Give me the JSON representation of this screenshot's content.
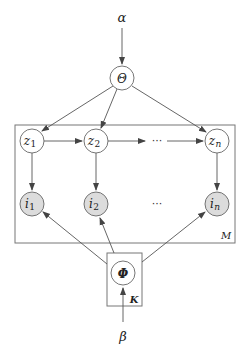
{
  "diagram": {
    "type": "plate-notation graphical model",
    "hyperparameters": {
      "alpha": "α",
      "beta": "β"
    },
    "nodes": {
      "theta": {
        "label": "Θ",
        "kind": "latent"
      },
      "phi": {
        "label": "Φ",
        "kind": "latent"
      },
      "z1": {
        "base": "z",
        "sub": "1",
        "kind": "latent"
      },
      "z2": {
        "base": "z",
        "sub": "2",
        "kind": "latent"
      },
      "zn": {
        "base": "z",
        "sub": "n",
        "kind": "latent"
      },
      "i1": {
        "base": "i",
        "sub": "1",
        "kind": "observed"
      },
      "i2": {
        "base": "i",
        "sub": "2",
        "kind": "observed"
      },
      "in": {
        "base": "i",
        "sub": "n",
        "kind": "observed"
      }
    },
    "ellipsis": "···",
    "plates": {
      "outer": {
        "label": "M"
      },
      "inner": {
        "label": "K"
      }
    },
    "edges": [
      [
        "alpha",
        "theta"
      ],
      [
        "theta",
        "z1"
      ],
      [
        "theta",
        "z2"
      ],
      [
        "theta",
        "zn"
      ],
      [
        "z1",
        "z2"
      ],
      [
        "z2",
        "ellipsis"
      ],
      [
        "ellipsis",
        "zn"
      ],
      [
        "z1",
        "i1"
      ],
      [
        "z2",
        "i2"
      ],
      [
        "zn",
        "in"
      ],
      [
        "phi",
        "i1"
      ],
      [
        "phi",
        "i2"
      ],
      [
        "phi",
        "in"
      ],
      [
        "beta",
        "phi"
      ]
    ]
  }
}
